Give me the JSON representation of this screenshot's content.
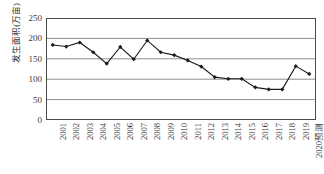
{
  "chart_data": {
    "type": "line",
    "title": "",
    "xlabel": "",
    "ylabel": "发生面积(万亩)",
    "ylim": [
      0,
      250
    ],
    "yticks": [
      0,
      50,
      100,
      150,
      200,
      250
    ],
    "grid": true,
    "legend": "none",
    "marker": "filled-diamond",
    "line_color": "#1a1a1a",
    "grid_color": "#8f8f8f",
    "categories": [
      "2001",
      "2002",
      "2003",
      "2004",
      "2005",
      "2006",
      "2007",
      "2008",
      "2009",
      "2010",
      "2011",
      "2012",
      "2013",
      "2014",
      "2015",
      "2016",
      "2017",
      "2018",
      "2019",
      "2020预测"
    ],
    "values": [
      184,
      180,
      190,
      166,
      138,
      179,
      149,
      195,
      166,
      159,
      146,
      131,
      105,
      101,
      101,
      80,
      75,
      75,
      132,
      113
    ],
    "series": [
      {
        "name": "发生面积",
        "values": [
          184,
          180,
          190,
          166,
          138,
          179,
          149,
          195,
          166,
          159,
          146,
          131,
          105,
          101,
          101,
          80,
          75,
          75,
          132,
          113
        ]
      }
    ]
  },
  "axis": {
    "y_title": "发生面积(万亩)",
    "y_tick_labels": [
      "250",
      "200",
      "150",
      "100",
      "50",
      "0"
    ]
  }
}
